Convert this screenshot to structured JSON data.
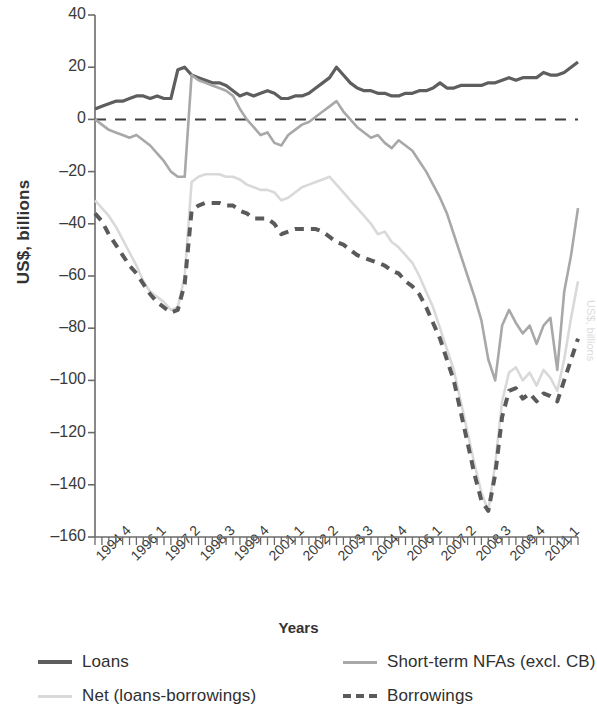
{
  "chart_data": {
    "type": "line",
    "title": "",
    "xlabel": "Years",
    "ylabel": "US$, billions",
    "ylim": [
      -160,
      40
    ],
    "yticks": [
      40,
      20,
      0,
      -20,
      -40,
      -60,
      -80,
      -100,
      -120,
      -140,
      -160
    ],
    "ytick_labels": [
      "40",
      "20",
      "0",
      "–20",
      "–40",
      "–60",
      "–80",
      "–100",
      "–120",
      "–140",
      "–160"
    ],
    "grid": false,
    "zero_line": true,
    "legend_position": "below",
    "xtick_labels": [
      "1994 4",
      "1996 1",
      "1997 2",
      "1998 3",
      "1999 4",
      "2001 1",
      "2002 2",
      "2003 3",
      "2004 4",
      "2006 1",
      "2007 2",
      "2008 3",
      "2009 4",
      "2011 1"
    ],
    "xtick_indices": [
      0,
      5,
      10,
      15,
      20,
      25,
      30,
      35,
      40,
      45,
      50,
      55,
      60,
      65
    ],
    "x": [
      "1994 4",
      "1995 1",
      "1995 2",
      "1995 3",
      "1995 4",
      "1996 1",
      "1996 2",
      "1996 3",
      "1996 4",
      "1997 1",
      "1997 2",
      "1997 3",
      "1997 4",
      "1998 1",
      "1998 2",
      "1998 3",
      "1998 4",
      "1999 1",
      "1999 2",
      "1999 3",
      "1999 4",
      "2000 1",
      "2000 2",
      "2000 3",
      "2000 4",
      "2001 1",
      "2001 2",
      "2001 3",
      "2001 4",
      "2002 1",
      "2002 2",
      "2002 3",
      "2002 4",
      "2003 1",
      "2003 2",
      "2003 3",
      "2003 4",
      "2004 1",
      "2004 2",
      "2004 3",
      "2004 4",
      "2005 1",
      "2005 2",
      "2005 3",
      "2005 4",
      "2006 1",
      "2006 2",
      "2006 3",
      "2006 4",
      "2007 1",
      "2007 2",
      "2007 3",
      "2007 4",
      "2008 1",
      "2008 2",
      "2008 3",
      "2008 4",
      "2009 1",
      "2009 2",
      "2009 3",
      "2009 4",
      "2010 1",
      "2010 2",
      "2010 3",
      "2010 4",
      "2011 1",
      "2011 2",
      "2011 3",
      "2011 4",
      "2012 1",
      "2012 2"
    ],
    "series": [
      {
        "name": "Loans",
        "color": "#5e5e5e",
        "style": "solid",
        "width": 3.2,
        "values": [
          4,
          5,
          6,
          7,
          7,
          8,
          9,
          9,
          8,
          9,
          8,
          8,
          19,
          20,
          17,
          16,
          15,
          14,
          14,
          13,
          11,
          9,
          10,
          9,
          10,
          11,
          10,
          8,
          8,
          9,
          9,
          10,
          12,
          14,
          16,
          20,
          17,
          14,
          12,
          11,
          11,
          10,
          10,
          9,
          9,
          10,
          10,
          11,
          11,
          12,
          14,
          12,
          12,
          13,
          13,
          13,
          13,
          14,
          14,
          15,
          16,
          15,
          16,
          16,
          16,
          18,
          17,
          17,
          18,
          20,
          22
        ]
      },
      {
        "name": "Short-term NFAs (excl. CB)",
        "color": "#a8a8a8",
        "style": "solid",
        "width": 2.6,
        "values": [
          0,
          -2,
          -4,
          -5,
          -6,
          -7,
          -6,
          -8,
          -10,
          -13,
          -16,
          -20,
          -22,
          -22,
          17,
          15,
          14,
          13,
          12,
          11,
          9,
          4,
          0,
          -3,
          -6,
          -5,
          -9,
          -10,
          -6,
          -4,
          -2,
          -1,
          1,
          3,
          5,
          7,
          3,
          0,
          -3,
          -5,
          -7,
          -6,
          -9,
          -11,
          -8,
          -10,
          -12,
          -16,
          -20,
          -25,
          -30,
          -36,
          -44,
          -52,
          -60,
          -68,
          -77,
          -92,
          -100,
          -79,
          -73,
          -78,
          -82,
          -79,
          -86,
          -79,
          -76,
          -96,
          -66,
          -52,
          -34
        ]
      },
      {
        "name": "Net (loans-borrowings)",
        "color": "#d9d9d9",
        "style": "solid",
        "width": 2.6,
        "values": [
          -31,
          -34,
          -37,
          -41,
          -46,
          -51,
          -56,
          -62,
          -66,
          -68,
          -70,
          -73,
          -72,
          -60,
          -24,
          -22,
          -21,
          -21,
          -21,
          -22,
          -22,
          -23,
          -25,
          -26,
          -27,
          -27,
          -28,
          -31,
          -30,
          -28,
          -26,
          -25,
          -24,
          -23,
          -22,
          -25,
          -28,
          -31,
          -34,
          -37,
          -40,
          -44,
          -43,
          -47,
          -49,
          -52,
          -55,
          -60,
          -66,
          -72,
          -80,
          -88,
          -96,
          -108,
          -120,
          -132,
          -143,
          -150,
          -132,
          -108,
          -97,
          -95,
          -100,
          -97,
          -102,
          -96,
          -99,
          -104,
          -92,
          -76,
          -62
        ]
      },
      {
        "name": "Borrowings",
        "color": "#5a5a5a",
        "style": "dashed",
        "width": 4,
        "values": [
          -36,
          -39,
          -44,
          -48,
          -52,
          -56,
          -59,
          -63,
          -67,
          -70,
          -72,
          -74,
          -73,
          -63,
          -35,
          -33,
          -32,
          -32,
          -32,
          -33,
          -33,
          -35,
          -36,
          -38,
          -38,
          -38,
          -40,
          -44,
          -43,
          -42,
          -42,
          -42,
          -42,
          -43,
          -45,
          -47,
          -48,
          -50,
          -52,
          -53,
          -54,
          -55,
          -56,
          -58,
          -59,
          -62,
          -64,
          -67,
          -72,
          -78,
          -84,
          -92,
          -100,
          -112,
          -124,
          -136,
          -146,
          -150,
          -136,
          -114,
          -104,
          -103,
          -107,
          -105,
          -108,
          -105,
          -106,
          -108,
          -100,
          -92,
          -84
        ]
      }
    ]
  },
  "axis": {
    "ylabel": "US$, billions",
    "xlabel": "Years"
  },
  "legend": {
    "items": [
      {
        "label": "Loans",
        "color": "#5e5e5e",
        "style": "solid",
        "thickness": "4px"
      },
      {
        "label": "Short-term NFAs (excl. CB)",
        "color": "#a8a8a8",
        "style": "solid",
        "thickness": "3px"
      },
      {
        "label": "Net (loans-borrowings)",
        "color": "#d9d9d9",
        "style": "solid",
        "thickness": "3px"
      },
      {
        "label": "Borrowings",
        "color": "#5a5a5a",
        "style": "dashed",
        "thickness": "4px"
      }
    ]
  },
  "edge": {
    "clipped_text": "US$, billions"
  }
}
